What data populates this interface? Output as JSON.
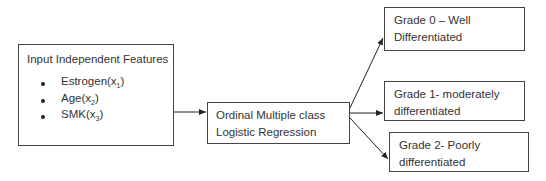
{
  "input_box": {
    "title": "Input Independent Features",
    "features": [
      {
        "name": "Estrogen(x",
        "sub": "1",
        "close": ")"
      },
      {
        "name": "Age(x",
        "sub": "2",
        "close": ")"
      },
      {
        "name": "SMK(x",
        "sub": "3",
        "close": ")"
      }
    ]
  },
  "model_box": {
    "line1": "Ordinal Multiple class",
    "line2": "Logistic Regression"
  },
  "outputs": [
    {
      "line1": "Grade 0 – Well",
      "line2": "Differentiated"
    },
    {
      "line1": "Grade 1- moderately",
      "line2": "differentiated"
    },
    {
      "line1": "Grade 2- Poorly",
      "line2": "differentiated"
    }
  ]
}
